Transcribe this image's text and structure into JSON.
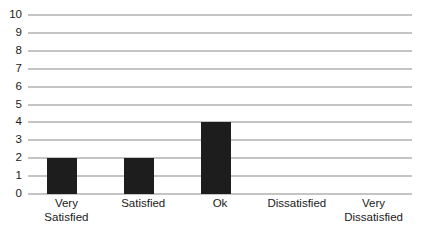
{
  "chart_data": {
    "type": "bar",
    "title": "",
    "subtitle": "",
    "xlabel": "",
    "ylabel": "",
    "categories": [
      "Very Satisfied",
      "Satisfied",
      "Ok",
      "Dissatisfied",
      "Very Dissatisfied"
    ],
    "category_label_lines": [
      [
        "Very",
        "Satisfied"
      ],
      [
        "Satisfied"
      ],
      [
        "Ok"
      ],
      [
        "Dissatisfied"
      ],
      [
        "Very",
        "Dissatisfied"
      ]
    ],
    "values": [
      2,
      2,
      4,
      0,
      0
    ],
    "ylim": [
      0,
      10
    ],
    "ytick_labels": [
      "10",
      "9",
      "8",
      "7",
      "6",
      "5",
      "4",
      "3",
      "2",
      "1",
      "0"
    ],
    "ytick_values": [
      10,
      9,
      8,
      7,
      6,
      5,
      4,
      3,
      2,
      1,
      0
    ],
    "grid": true,
    "grid_axis": "y",
    "legend": false,
    "legend_position": "none",
    "bar_color": "#1d1d1d",
    "grid_color": "#8a8a8a",
    "background_color": "#ffffff",
    "text_color": "#1a1a1a"
  }
}
